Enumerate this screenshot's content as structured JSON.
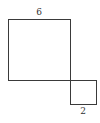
{
  "diagram": {
    "type": "geometry",
    "shapes": [
      {
        "name": "large-square",
        "side_label": "6",
        "label_position": "top"
      },
      {
        "name": "small-square",
        "side_label": "2",
        "label_position": "bottom"
      }
    ],
    "colors": {
      "stroke": "#3a3a3a",
      "label": "#333333",
      "background": "#ffffff"
    }
  }
}
